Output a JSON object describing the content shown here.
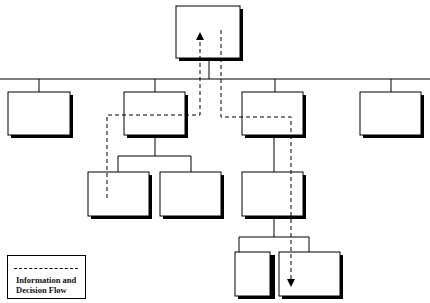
{
  "diagram": {
    "type": "organizational-hierarchy",
    "boxes": [
      {
        "id": "top",
        "x": 176,
        "y": 6,
        "w": 64,
        "h": 52
      },
      {
        "id": "l1-a",
        "x": 8,
        "y": 92,
        "w": 62,
        "h": 43
      },
      {
        "id": "l1-b",
        "x": 124,
        "y": 92,
        "w": 61,
        "h": 43
      },
      {
        "id": "l1-c",
        "x": 242,
        "y": 92,
        "w": 61,
        "h": 43
      },
      {
        "id": "l1-d",
        "x": 360,
        "y": 92,
        "w": 61,
        "h": 43
      },
      {
        "id": "l2-a",
        "x": 88,
        "y": 172,
        "w": 61,
        "h": 44
      },
      {
        "id": "l2-b",
        "x": 160,
        "y": 172,
        "w": 61,
        "h": 44
      },
      {
        "id": "l2-c",
        "x": 242,
        "y": 172,
        "w": 61,
        "h": 44
      },
      {
        "id": "l3-a",
        "x": 235,
        "y": 252,
        "w": 61,
        "h": 44
      },
      {
        "id": "l3-b",
        "x": 279,
        "y": 252,
        "w": 61,
        "h": 44
      }
    ]
  },
  "legend": {
    "label_line1": "Information and",
    "label_line2": "Decision Flow"
  }
}
